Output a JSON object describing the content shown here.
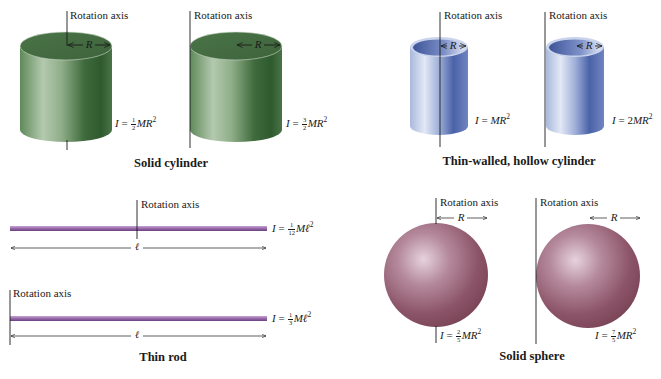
{
  "figure": {
    "groups": [
      {
        "id": "solid-cylinder",
        "caption": "Solid cylinder",
        "color": "#4f7a4c",
        "items": [
          {
            "axis_label": "Rotation axis",
            "radius_label": "R",
            "equation": {
              "lhs": "I",
              "coef_num": "1",
              "coef_den": "2",
              "rhs": "MR",
              "exp": "2"
            }
          },
          {
            "axis_label": "Rotation axis",
            "radius_label": "R",
            "equation": {
              "lhs": "I",
              "coef_num": "3",
              "coef_den": "2",
              "rhs": "MR",
              "exp": "2"
            }
          }
        ]
      },
      {
        "id": "thin-walled-hollow-cylinder",
        "caption": "Thin-walled, hollow cylinder",
        "color": "#6a7fb5",
        "items": [
          {
            "axis_label": "Rotation axis",
            "radius_label": "R",
            "equation": {
              "lhs": "I",
              "coef": "",
              "rhs": "MR",
              "exp": "2"
            }
          },
          {
            "axis_label": "Rotation axis",
            "radius_label": "R",
            "equation": {
              "lhs": "I",
              "coef": "2",
              "rhs": "MR",
              "exp": "2"
            }
          }
        ]
      },
      {
        "id": "thin-rod",
        "caption": "Thin rod",
        "color": "#9a6fa8",
        "items": [
          {
            "axis_label": "Rotation axis",
            "length_label": "ℓ",
            "equation": {
              "lhs": "I",
              "coef_num": "1",
              "coef_den": "12",
              "rhs": "Mℓ",
              "exp": "2"
            }
          },
          {
            "axis_label": "Rotation axis",
            "length_label": "ℓ",
            "equation": {
              "lhs": "I",
              "coef_num": "1",
              "coef_den": "3",
              "rhs": "Mℓ",
              "exp": "2"
            }
          }
        ]
      },
      {
        "id": "solid-sphere",
        "caption": "Solid sphere",
        "color": "#8a4f62",
        "items": [
          {
            "axis_label": "Rotation axis",
            "radius_label": "R",
            "equation": {
              "lhs": "I",
              "coef_num": "2",
              "coef_den": "5",
              "rhs": "MR",
              "exp": "2"
            }
          },
          {
            "axis_label": "Rotation axis",
            "radius_label": "R",
            "equation": {
              "lhs": "I",
              "coef_num": "7",
              "coef_den": "5",
              "rhs": "MR",
              "exp": "2"
            }
          }
        ]
      }
    ],
    "equals": "="
  }
}
